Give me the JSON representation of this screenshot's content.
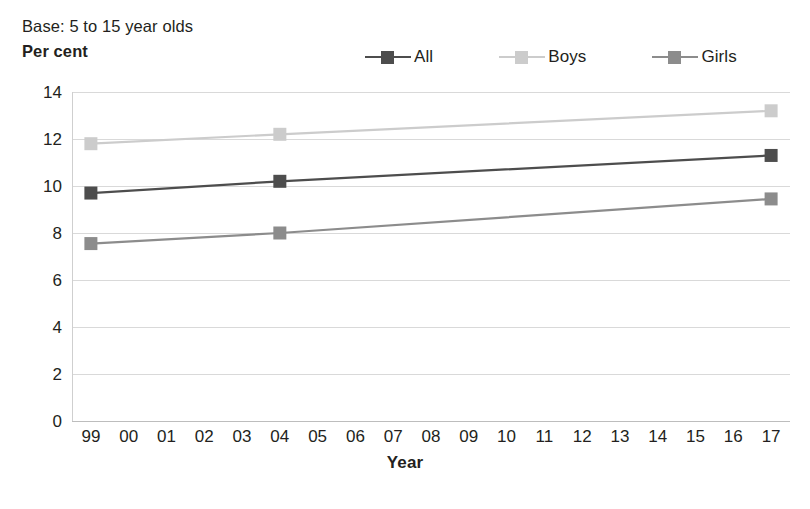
{
  "header": {
    "base_note": "Base: 5 to 15 year olds",
    "y_axis_title": "Per cent"
  },
  "legend": {
    "items": [
      {
        "label": "All",
        "color": "#4d4d4d",
        "icon": "line-marker-icon"
      },
      {
        "label": "Boys",
        "color": "#cccccc",
        "icon": "line-marker-icon"
      },
      {
        "label": "Girls",
        "color": "#8c8c8c",
        "icon": "line-marker-icon"
      }
    ]
  },
  "axes": {
    "x_title": "Year",
    "y_title": "Per cent",
    "y_ticks": [
      "14",
      "12",
      "10",
      "8",
      "6",
      "4",
      "2",
      "0"
    ],
    "x_ticks": [
      "99",
      "00",
      "01",
      "02",
      "03",
      "04",
      "05",
      "06",
      "07",
      "08",
      "09",
      "10",
      "11",
      "12",
      "13",
      "14",
      "15",
      "16",
      "17"
    ]
  },
  "chart_data": {
    "type": "line",
    "title": "",
    "subtitle": "Base: 5 to 15 year olds",
    "xlabel": "Year",
    "ylabel": "Per cent",
    "ylim": [
      0,
      14
    ],
    "ytick_step": 2,
    "grid": true,
    "legend_position": "top-right",
    "categories": [
      "99",
      "00",
      "01",
      "02",
      "03",
      "04",
      "05",
      "06",
      "07",
      "08",
      "09",
      "10",
      "11",
      "12",
      "13",
      "14",
      "15",
      "16",
      "17"
    ],
    "x": [
      1999,
      2000,
      2001,
      2002,
      2003,
      2004,
      2005,
      2006,
      2007,
      2008,
      2009,
      2010,
      2011,
      2012,
      2013,
      2014,
      2015,
      2016,
      2017
    ],
    "marker_years": [
      "99",
      "04",
      "17"
    ],
    "series": [
      {
        "name": "All",
        "color": "#4d4d4d",
        "points": [
          {
            "year": "99",
            "value": 9.7
          },
          {
            "year": "04",
            "value": 10.2
          },
          {
            "year": "17",
            "value": 11.3
          }
        ]
      },
      {
        "name": "Boys",
        "color": "#cccccc",
        "points": [
          {
            "year": "99",
            "value": 11.8
          },
          {
            "year": "04",
            "value": 12.2
          },
          {
            "year": "17",
            "value": 13.2
          }
        ]
      },
      {
        "name": "Girls",
        "color": "#8c8c8c",
        "points": [
          {
            "year": "99",
            "value": 7.55
          },
          {
            "year": "04",
            "value": 8.0
          },
          {
            "year": "17",
            "value": 9.45
          }
        ]
      }
    ]
  },
  "colors": {
    "all": "#4d4d4d",
    "boys": "#cccccc",
    "girls": "#8c8c8c",
    "gridline": "#d9d9d9",
    "text": "#231f20",
    "background": "#ffffff"
  }
}
